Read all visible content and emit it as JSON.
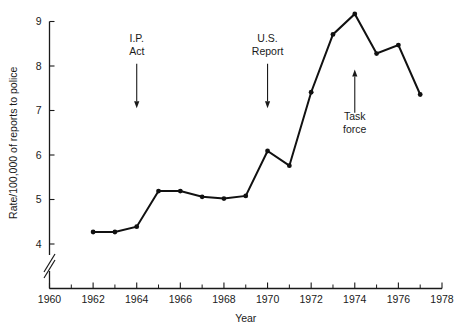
{
  "chart_data": {
    "type": "line",
    "title": "",
    "xlabel": "Year",
    "ylabel": "Rate/100,000 of reports to police",
    "xlim": [
      1960,
      1978
    ],
    "ylim": [
      3.7,
      9.3
    ],
    "grid": false,
    "legend": null,
    "y_axis_broken": true,
    "y_break_below": 4,
    "x_ticks_major": [
      1960,
      1962,
      1964,
      1966,
      1968,
      1970,
      1972,
      1974,
      1976,
      1978
    ],
    "x_tick_labels": [
      "1960",
      "1962",
      "1964",
      "1966",
      "1968",
      "1970",
      "1972",
      "1974",
      "1976",
      "1978"
    ],
    "x_ticks_minor": [
      1961,
      1963,
      1965,
      1967,
      1969,
      1971,
      1973,
      1975,
      1977
    ],
    "y_ticks": [
      4,
      5,
      6,
      7,
      8,
      9
    ],
    "y_tick_labels": [
      "4",
      "5",
      "6",
      "7",
      "8",
      "9"
    ],
    "x": [
      1962,
      1963,
      1964,
      1965,
      1966,
      1967,
      1968,
      1969,
      1970,
      1971,
      1972,
      1973,
      1974,
      1975,
      1976,
      1977
    ],
    "values": [
      4.27,
      4.27,
      4.39,
      5.19,
      5.19,
      5.06,
      5.02,
      5.08,
      6.09,
      5.76,
      7.41,
      8.71,
      9.17,
      8.28,
      8.47,
      7.36
    ],
    "series": [
      {
        "name": "Rate of reports to police",
        "values": [
          4.27,
          4.27,
          4.39,
          5.19,
          5.19,
          5.06,
          5.02,
          5.08,
          6.09,
          5.76,
          7.41,
          8.71,
          9.17,
          8.28,
          8.47,
          7.36
        ]
      }
    ],
    "annotations": [
      {
        "id": "ip-act",
        "label_line1": "I.P.",
        "label_line2": "Act",
        "x": 1964,
        "direction": "down",
        "text_y": 8.55,
        "arrow_from_y": 8.05,
        "arrow_to_y": 7.05
      },
      {
        "id": "us-report",
        "label_line1": "U.S.",
        "label_line2": "Report",
        "x": 1970,
        "direction": "down",
        "text_y": 8.55,
        "arrow_from_y": 8.05,
        "arrow_to_y": 7.05
      },
      {
        "id": "task-force",
        "label_line1": "Task",
        "label_line2": "force",
        "x": 1974,
        "direction": "up",
        "text_y": 6.78,
        "arrow_from_y": 6.95,
        "arrow_to_y": 7.92
      }
    ],
    "colors": {
      "line": "#111111",
      "marker": "#111111",
      "axis": "#1a1a1a",
      "background": "#ffffff"
    }
  }
}
